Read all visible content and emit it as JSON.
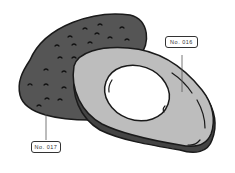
{
  "illustration": {
    "subject": "avocado",
    "skin_color": "#555555",
    "flesh_color": "#bdbdbd",
    "pit_hole_color": "#ffffff",
    "outline_color": "#1a1a1a"
  },
  "labels": {
    "cut_half": "No. 016",
    "whole_half": "No. 017"
  }
}
